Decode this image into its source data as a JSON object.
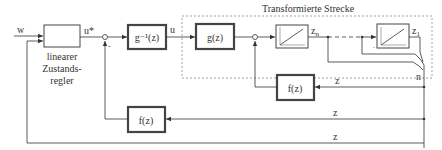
{
  "diagram": {
    "title": "Transformierte Strecke",
    "signals": {
      "w": "w",
      "u_star": "u*",
      "u": "u",
      "z_n": "z",
      "z_n_sub": "n",
      "z_1": "z",
      "z_1_sub": "1",
      "n": "n",
      "z_inner": "z",
      "z_mid": "z",
      "z_bottom": "z"
    },
    "blocks": {
      "controller": {
        "label_line1": "linearer",
        "label_line2": "Zustands-",
        "label_line3": "regler"
      },
      "g_inv": {
        "label": "g⁻¹(z)"
      },
      "g": {
        "label": "g(z)"
      },
      "integrator_n": {
        "label": ""
      },
      "integrator_1": {
        "label": ""
      },
      "f_inner": {
        "label": "f(z)"
      },
      "f_outer": {
        "label": "f(z)"
      }
    },
    "sum_signs": {
      "s1_minus": "-",
      "s2_dot": "."
    },
    "colors": {
      "line": "#333333",
      "dashed": "#888888",
      "thick_block_border": "#444444"
    }
  }
}
